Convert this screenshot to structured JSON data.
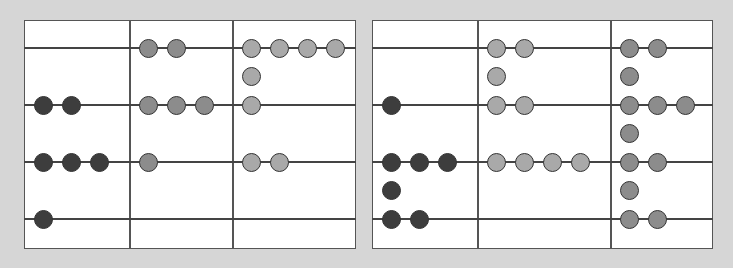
{
  "diagram": {
    "type": "place-value-chart-beads",
    "colors": {
      "background": "#d6d6d6",
      "panel": "#ffffff",
      "line": "#444444",
      "dark_bead": "#3d3d3d",
      "mid_bead": "#8c8c8c",
      "light_bead": "#a9a9a9"
    },
    "rows_y": [
      48,
      105,
      162,
      219
    ],
    "panels": [
      {
        "name": "left-panel",
        "x": 24,
        "y": 20,
        "w": 332,
        "h": 229,
        "dividers": [
          129,
          232
        ],
        "columns": [
          {
            "name": "column-1",
            "x": 24,
            "color": "dark_bead",
            "rows": [
              0,
              2,
              3,
              1
            ]
          },
          {
            "name": "column-2",
            "x": 129,
            "color": "mid_bead",
            "rows": [
              2,
              3,
              1,
              0
            ]
          },
          {
            "name": "column-3",
            "x": 232,
            "color": "light_bead",
            "rows": [
              4,
              1,
              2,
              0
            ],
            "extra": [
              {
                "between": [
                  0,
                  1
                ],
                "count": 1
              }
            ]
          }
        ]
      },
      {
        "name": "right-panel",
        "x": 372,
        "y": 20,
        "w": 341,
        "h": 229,
        "dividers": [
          477,
          610
        ],
        "columns": [
          {
            "name": "column-1",
            "x": 372,
            "color": "dark_bead",
            "rows": [
              0,
              1,
              3,
              2
            ],
            "extra": [
              {
                "between": [
                  2,
                  3
                ],
                "count": 1
              }
            ]
          },
          {
            "name": "column-2",
            "x": 477,
            "color": "light_bead",
            "rows": [
              2,
              2,
              4,
              0
            ],
            "extra": [
              {
                "between": [
                  0,
                  1
                ],
                "count": 1
              }
            ]
          },
          {
            "name": "column-3",
            "x": 610,
            "color": "mid_bead",
            "rows": [
              2,
              3,
              2,
              2
            ],
            "extra": [
              {
                "between": [
                  0,
                  1
                ],
                "count": 1
              },
              {
                "between": [
                  1,
                  2
                ],
                "count": 1
              },
              {
                "between": [
                  2,
                  3
                ],
                "count": 1
              }
            ]
          }
        ]
      }
    ]
  }
}
